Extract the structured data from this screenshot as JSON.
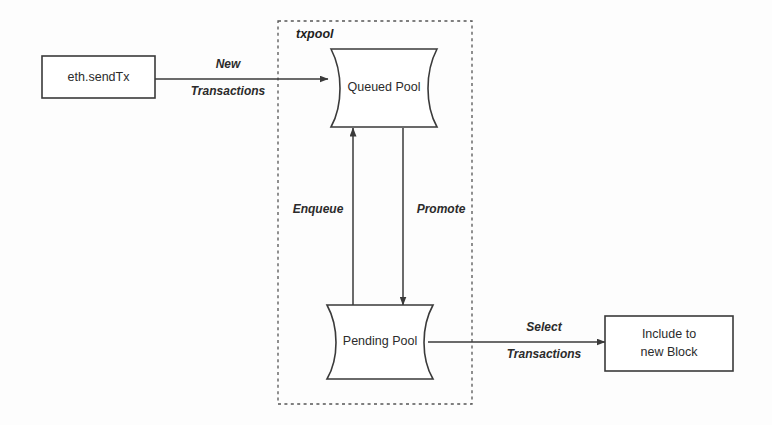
{
  "diagram": {
    "background_color": "#fdfdfd",
    "stroke_color": "#3a3a3a",
    "group": {
      "label": "txpool",
      "style": "dashed-boundary"
    },
    "nodes": [
      {
        "id": "eth-send-tx",
        "label": "eth.sendTx",
        "shape": "rectangle"
      },
      {
        "id": "queued-pool",
        "label": "Queued Pool",
        "shape": "data-store"
      },
      {
        "id": "pending-pool",
        "label": "Pending Pool",
        "shape": "data-store"
      },
      {
        "id": "include-to-new-block",
        "label_line1": "Include to",
        "label_line2": "new Block",
        "shape": "rectangle"
      }
    ],
    "edges": [
      {
        "id": "new-transactions",
        "from": "eth-send-tx",
        "to": "queued-pool",
        "label_line1": "New",
        "label_line2": "Transactions",
        "direction": "right"
      },
      {
        "id": "enqueue",
        "from": "pending-pool",
        "to": "queued-pool",
        "label_line1": "Enqueue",
        "label_line2": "",
        "direction": "up"
      },
      {
        "id": "promote",
        "from": "queued-pool",
        "to": "pending-pool",
        "label_line1": "Promote",
        "label_line2": "",
        "direction": "down"
      },
      {
        "id": "select-transactions",
        "from": "pending-pool",
        "to": "include-to-new-block",
        "label_line1": "Select",
        "label_line2": "Transactions",
        "direction": "right"
      }
    ]
  }
}
